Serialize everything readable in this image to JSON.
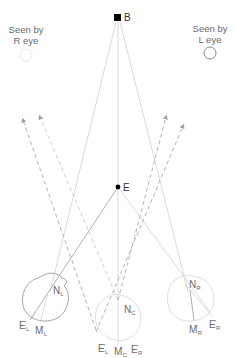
{
  "diagram": {
    "colors": {
      "line_light": "#d6d6d6",
      "line_mid": "#a8a8a8",
      "line_dark": "#8a8a8a",
      "dashed": "#b0b0b0",
      "point": "#000000",
      "text": "#6a6a6a"
    },
    "captions": {
      "left": {
        "line1": "Seen by",
        "line2": "R eye"
      },
      "right": {
        "line1": "Seen by",
        "line2": "L eye"
      }
    },
    "points": {
      "B": {
        "label": "B",
        "x": 118,
        "y": 18,
        "shape": "square"
      },
      "E": {
        "label": "E",
        "x": 118,
        "y": 187,
        "shape": "dot"
      }
    },
    "eyes": [
      {
        "id": "left",
        "center": [
          46,
          297
        ],
        "radius": 22,
        "nodal": {
          "base": "N",
          "sub": "L"
        },
        "labels": [
          {
            "base": "E",
            "prime": "'",
            "sub": "L"
          },
          {
            "base": "M",
            "prime": "'",
            "sub": "L"
          }
        ]
      },
      {
        "id": "cyclopean",
        "center": [
          118,
          318
        ],
        "radius": 23,
        "nodal": {
          "base": "N",
          "sub": "C"
        },
        "labels": [
          {
            "base": "E",
            "prime": "'",
            "sub": "L"
          },
          {
            "base": "M",
            "prime": "'",
            "sub": "C"
          },
          {
            "base": "E",
            "prime": "'",
            "sub": "R"
          }
        ]
      },
      {
        "id": "right",
        "center": [
          190,
          297
        ],
        "radius": 22,
        "nodal": {
          "base": "N",
          "sub": "R"
        },
        "labels": [
          {
            "base": "M",
            "prime": "'",
            "sub": "R"
          },
          {
            "base": "E",
            "prime": "'",
            "sub": "R"
          }
        ]
      }
    ]
  }
}
